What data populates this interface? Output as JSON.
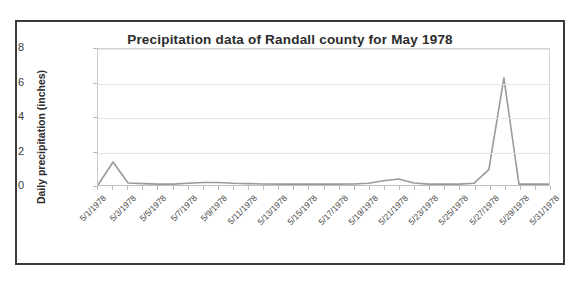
{
  "figure": {
    "title": "Precipitation data of Randall county for May 1978",
    "border_color": "#3b3b3b",
    "background": "#ffffff"
  },
  "chart_data": {
    "type": "line",
    "title": "Precipitation data of Randall county for May 1978",
    "xlabel": "",
    "ylabel": "Daily precipitation (inches)",
    "ylim": [
      0,
      8
    ],
    "yticks": [
      0,
      2,
      4,
      6,
      8
    ],
    "grid": true,
    "legend": false,
    "line_color": "#9a9a9a",
    "x_tick_labels": [
      "5/1/1978",
      "5/3/1978",
      "5/5/1978",
      "5/7/1978",
      "5/9/1978",
      "5/11/1978",
      "5/13/1978",
      "5/15/1978",
      "5/17/1978",
      "5/19/1978",
      "5/21/1978",
      "5/23/1978",
      "5/25/1978",
      "5/27/1978",
      "5/29/1978",
      "5/31/1978"
    ],
    "x": [
      "5/1/1978",
      "5/2/1978",
      "5/3/1978",
      "5/4/1978",
      "5/5/1978",
      "5/6/1978",
      "5/7/1978",
      "5/8/1978",
      "5/9/1978",
      "5/10/1978",
      "5/11/1978",
      "5/12/1978",
      "5/13/1978",
      "5/14/1978",
      "5/15/1978",
      "5/16/1978",
      "5/17/1978",
      "5/18/1978",
      "5/19/1978",
      "5/20/1978",
      "5/21/1978",
      "5/22/1978",
      "5/23/1978",
      "5/24/1978",
      "5/25/1978",
      "5/26/1978",
      "5/27/1978",
      "5/28/1978",
      "5/29/1978",
      "5/30/1978",
      "5/31/1978"
    ],
    "values": [
      0.0,
      1.35,
      0.12,
      0.08,
      0.05,
      0.05,
      0.1,
      0.15,
      0.15,
      0.1,
      0.08,
      0.06,
      0.05,
      0.05,
      0.05,
      0.05,
      0.05,
      0.06,
      0.1,
      0.25,
      0.35,
      0.12,
      0.05,
      0.05,
      0.05,
      0.1,
      0.9,
      6.3,
      0.05,
      0.05,
      0.05
    ],
    "series": [
      {
        "name": "Daily precipitation (inches)",
        "values": [
          0.0,
          1.35,
          0.12,
          0.08,
          0.05,
          0.05,
          0.1,
          0.15,
          0.15,
          0.1,
          0.08,
          0.06,
          0.05,
          0.05,
          0.05,
          0.05,
          0.05,
          0.06,
          0.1,
          0.25,
          0.35,
          0.12,
          0.05,
          0.05,
          0.05,
          0.1,
          0.9,
          6.3,
          0.05,
          0.05,
          0.05
        ]
      }
    ]
  }
}
